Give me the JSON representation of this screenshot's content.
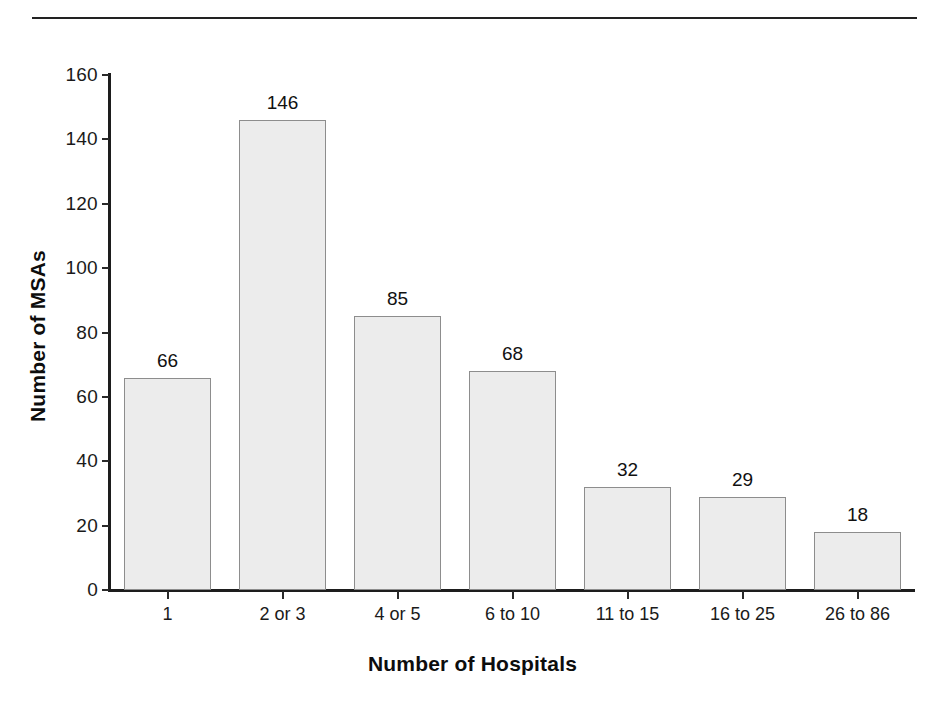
{
  "chart_data": {
    "type": "bar",
    "title": "",
    "xlabel": "Number of Hospitals",
    "ylabel": "Number of MSAs",
    "categories": [
      "1",
      "2 or 3",
      "4 or 5",
      "6 to 10",
      "11 to 15",
      "16 to 25",
      "26 to 86"
    ],
    "values": [
      66,
      146,
      85,
      68,
      32,
      29,
      18
    ],
    "value_labels": [
      "66",
      "146",
      "85",
      "68",
      "32",
      "29",
      "18"
    ],
    "ylim": [
      0,
      160
    ],
    "ytick_values": [
      0,
      20,
      40,
      60,
      80,
      100,
      120,
      140,
      160
    ],
    "ytick_labels": [
      "0",
      "20",
      "40",
      "60",
      "80",
      "100",
      "120",
      "140",
      "160"
    ],
    "grid": false,
    "legend": false,
    "bar_fill": "#ececec",
    "bar_border": "#8d8d8d",
    "axis_color": "#1d1d1d",
    "text_color": "#1a1a1a"
  },
  "decor": {
    "top_rule": "horizontal-rule"
  }
}
